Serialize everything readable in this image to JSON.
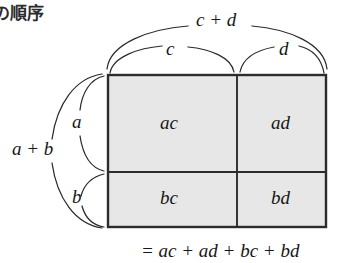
{
  "heading": {
    "text": "の順序"
  },
  "diagram": {
    "title_concept": "distributive-law-area-model",
    "top_braces": {
      "outer_label": "c + d",
      "left_label": "c",
      "right_label": "d"
    },
    "left_braces": {
      "outer_label": "a + b",
      "top_label": "a",
      "bottom_label": "b"
    },
    "grid": {
      "rows": [
        {
          "row_label": "a",
          "cells": [
            {
              "label": "ac"
            },
            {
              "label": "ad"
            }
          ]
        },
        {
          "row_label": "b",
          "cells": [
            {
              "label": "bc"
            },
            {
              "label": "bd"
            }
          ]
        }
      ],
      "column_labels": [
        "c",
        "d"
      ],
      "fill_color": "#e7e7e7",
      "border_color": "#2c2c2c"
    },
    "result_equation": "= ac + ad + bc + bd"
  }
}
